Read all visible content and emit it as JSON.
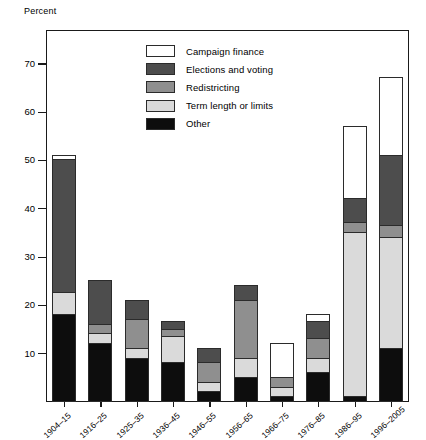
{
  "chart_data": {
    "type": "bar",
    "subtype": "stacked-bar",
    "title": "",
    "xlabel": "",
    "ylabel": "Percent",
    "ylim": [
      0,
      77
    ],
    "yticks": [
      10,
      20,
      30,
      40,
      50,
      60,
      70
    ],
    "grid": false,
    "legend_position": "inside-top-center",
    "categories": [
      "1904–15",
      "1916–25",
      "1925–35",
      "1936–45",
      "1946–55",
      "1956–65",
      "1966–75",
      "1976–85",
      "1986–95",
      "1996–2005"
    ],
    "series": [
      {
        "name": "Other",
        "color": "#0d0d0d",
        "values": [
          18,
          12,
          9,
          8,
          2,
          5,
          1,
          6,
          1,
          11
        ]
      },
      {
        "name": "Term length or limits",
        "color": "#dadada",
        "values": [
          4.5,
          2,
          2,
          5.5,
          2,
          4,
          2,
          3,
          34,
          23
        ]
      },
      {
        "name": "Redistricting",
        "color": "#8f8f8f",
        "values": [
          0,
          2,
          6,
          1.5,
          4,
          12,
          2,
          4,
          2,
          2.5
        ]
      },
      {
        "name": "Elections and voting",
        "color": "#4d4d4d",
        "values": [
          27.5,
          9,
          4,
          1.5,
          3,
          3,
          0,
          3.5,
          5,
          14.5
        ]
      },
      {
        "name": "Campaign finance",
        "color": "#ffffff",
        "values": [
          1,
          0,
          0,
          0,
          0,
          0,
          7,
          1.5,
          15,
          16
        ]
      }
    ],
    "totals": [
      51,
      25,
      21,
      16.5,
      11,
      24,
      12,
      18,
      57,
      67
    ],
    "stack_order": [
      "Other",
      "Term length or limits",
      "Redistricting",
      "Elections and voting",
      "Campaign finance"
    ]
  },
  "legend": {
    "items": [
      {
        "label": "Campaign finance",
        "color": "#ffffff"
      },
      {
        "label": "Elections and voting",
        "color": "#4d4d4d"
      },
      {
        "label": "Redistricting",
        "color": "#8f8f8f"
      },
      {
        "label": "Term length or limits",
        "color": "#dadada"
      },
      {
        "label": "Other",
        "color": "#0d0d0d"
      }
    ]
  }
}
